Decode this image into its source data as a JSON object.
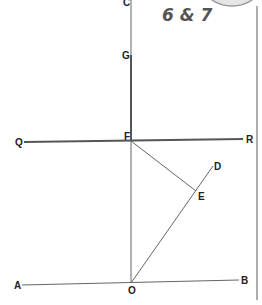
{
  "title": "6 & 7",
  "colors": {
    "line": "#666666",
    "thick_line": "#555555",
    "label": "#222222",
    "title": "#555555",
    "badge_fill": "#e6e6e6",
    "badge_stroke": "#9a9a9a"
  },
  "points": {
    "C": {
      "label": "C",
      "x": 131,
      "y": 0
    },
    "G": {
      "label": "G",
      "x": 131,
      "y": 55
    },
    "F": {
      "label": "F",
      "x": 131,
      "y": 141
    },
    "Q": {
      "label": "Q",
      "x": 22,
      "y": 142
    },
    "R": {
      "label": "R",
      "x": 243,
      "y": 139
    },
    "D": {
      "label": "D",
      "x": 213,
      "y": 166
    },
    "E": {
      "label": "E",
      "x": 196,
      "y": 191
    },
    "O": {
      "label": "O",
      "x": 131,
      "y": 283
    },
    "A": {
      "label": "A",
      "x": 20,
      "y": 285
    },
    "B": {
      "label": "B",
      "x": 239,
      "y": 280
    }
  },
  "segments": [
    {
      "from": "C",
      "to": "G",
      "style": "thin"
    },
    {
      "from": "G",
      "to": "F",
      "style": "thick"
    },
    {
      "from": "F",
      "to": "O",
      "style": "thin"
    },
    {
      "from": "Q",
      "to": "R",
      "style": "thick"
    },
    {
      "from": "F",
      "to": "E",
      "style": "thin"
    },
    {
      "from": "O",
      "to": "D",
      "style": "thin"
    },
    {
      "from": "A",
      "to": "B",
      "style": "thin"
    }
  ]
}
